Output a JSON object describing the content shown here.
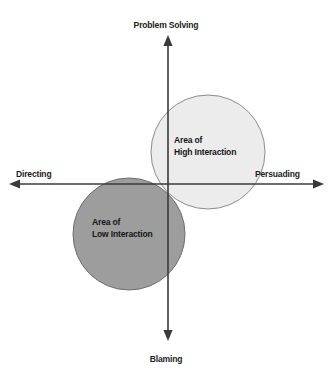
{
  "diagram": {
    "axes": {
      "top_label": "Problem Solving",
      "bottom_label": "Blaming",
      "left_label": "Directing",
      "right_label": "Persuading",
      "axis_color": "#3a3a3a",
      "origin": {
        "x": 168,
        "y": 184
      }
    },
    "circles": [
      {
        "name": "high-interaction",
        "label_line1": "Area of",
        "label_line2": "High Interaction",
        "fill": "#ececec",
        "stroke": "#8c8c8c",
        "cx": 208,
        "cy": 152,
        "r": 57,
        "quadrant": "upper-right"
      },
      {
        "name": "low-interaction",
        "label_line1": "Area of",
        "label_line2": "Low Interaction",
        "fill": "#9d9d9d",
        "stroke": "#6e6e6e",
        "cx": 129,
        "cy": 234,
        "r": 56,
        "quadrant": "lower-left"
      }
    ],
    "background": "#ffffff",
    "text_color": "#1c1c1c"
  }
}
